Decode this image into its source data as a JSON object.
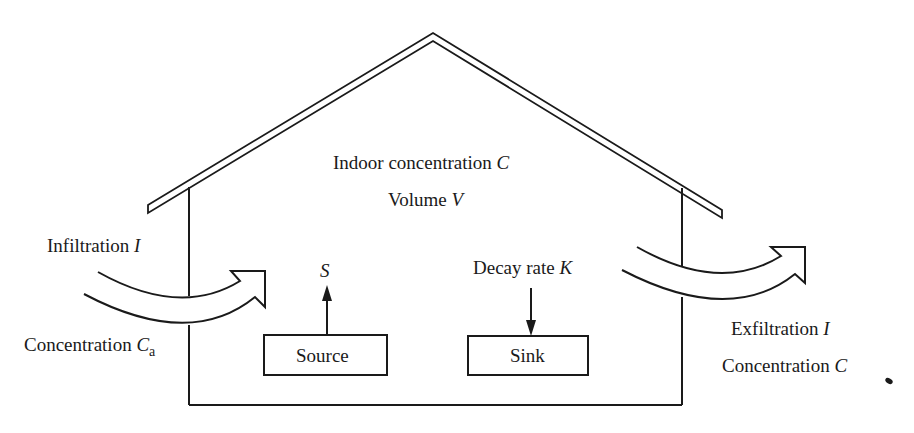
{
  "diagram": {
    "house": {
      "indoor_label": "Indoor concentration",
      "indoor_var": "C",
      "volume_label": "Volume",
      "volume_var": "V"
    },
    "inflow": {
      "label": "Infiltration",
      "var": "I",
      "conc_label": "Concentration",
      "conc_var": "C",
      "conc_sub": "a"
    },
    "outflow": {
      "label": "Exfiltration",
      "var": "I",
      "conc_label": "Concentration",
      "conc_var": "C"
    },
    "source": {
      "box_label": "Source",
      "rate_var": "S"
    },
    "sink": {
      "box_label": "Sink",
      "rate_label": "Decay rate",
      "rate_var": "K"
    },
    "colors": {
      "line": "#1a1a1a",
      "background": "#ffffff"
    }
  }
}
